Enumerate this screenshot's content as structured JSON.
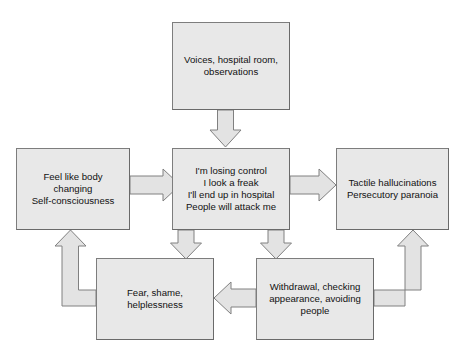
{
  "diagram": {
    "type": "flow-diagram",
    "background_color": "#ffffff",
    "box_fill_color": "#e8e8e8",
    "box_border_color": "#7d7d7d",
    "arrow_fill_color": "#e0e0e0",
    "arrow_border_color": "#808080",
    "text_color": "#111111",
    "nodes": [
      {
        "id": "trigger",
        "name": "trigger-node",
        "text": "Voices, hospital room,\nobservations",
        "lines": [
          "Voices, hospital room,",
          "observations"
        ]
      },
      {
        "id": "beliefs",
        "name": "beliefs-node",
        "text": "I'm losing control\nI look a freak\nI'll end up in hospital\nPeople will attack me",
        "lines": [
          "I'm losing control",
          "I look a freak",
          "I'll end up in hospital",
          "People will attack me"
        ]
      },
      {
        "id": "physical",
        "name": "physical-sensations-node",
        "text": "Feel like body\nchanging\nSelf-consciousness",
        "lines": [
          "Feel like body",
          "changing",
          "Self-consciousness"
        ]
      },
      {
        "id": "psychotic",
        "name": "psychotic-experiences-node",
        "text": "Tactile hallucinations\nPersecutory paranoia",
        "lines": [
          "Tactile hallucinations",
          "Persecutory paranoia"
        ]
      },
      {
        "id": "emotions",
        "name": "emotions-node",
        "text": "Fear, shame,\nhelplessness",
        "lines": [
          "Fear, shame,",
          "helplessness"
        ]
      },
      {
        "id": "behaviour",
        "name": "behaviour-node",
        "text": "Withdrawal, checking\nappearance, avoiding\npeople",
        "lines": [
          "Withdrawal, checking",
          "appearance, avoiding",
          "people"
        ]
      }
    ],
    "connectors": [
      {
        "id": "trigger-to-beliefs",
        "from": "trigger",
        "to": "beliefs",
        "direction": "down",
        "style": "block-arrow"
      },
      {
        "id": "physical-to-beliefs",
        "from": "physical",
        "to": "beliefs",
        "direction": "right",
        "style": "block-arrow"
      },
      {
        "id": "beliefs-to-psychotic",
        "from": "beliefs",
        "to": "psychotic",
        "direction": "right",
        "style": "block-arrow"
      },
      {
        "id": "beliefs-to-emotions",
        "from": "beliefs",
        "to": "emotions",
        "direction": "down",
        "style": "block-arrow"
      },
      {
        "id": "beliefs-to-behaviour",
        "from": "beliefs",
        "to": "behaviour",
        "direction": "down",
        "style": "block-arrow"
      },
      {
        "id": "behaviour-to-emotions",
        "from": "behaviour",
        "to": "emotions",
        "direction": "left",
        "style": "block-arrow"
      },
      {
        "id": "emotions-to-physical",
        "from": "emotions",
        "to": "physical",
        "direction": "up",
        "style": "elbow-block-arrow"
      },
      {
        "id": "behaviour-to-psychotic",
        "from": "behaviour",
        "to": "psychotic",
        "direction": "up",
        "style": "elbow-block-arrow"
      }
    ]
  }
}
